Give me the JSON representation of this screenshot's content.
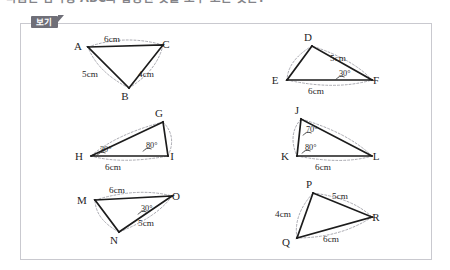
{
  "question": {
    "text": "다음은 삼각형 ABC와 합동인 것을 모두 고른 것은?"
  },
  "panel": {
    "badge_label": "보기"
  },
  "figures": [
    {
      "id": "abc",
      "name": "triangle-abc",
      "vertices": [
        {
          "label": "A",
          "x": 88,
          "y": 47,
          "lx": 78,
          "ly": 50
        },
        {
          "label": "C",
          "x": 163,
          "y": 45,
          "lx": 166,
          "ly": 48
        },
        {
          "label": "B",
          "x": 129,
          "y": 88,
          "lx": 125,
          "ly": 100
        }
      ],
      "measures": [
        {
          "text": "6cm",
          "x": 112,
          "y": 42
        },
        {
          "text": "5cm",
          "x": 90,
          "y": 77
        },
        {
          "text": "4cm",
          "x": 146,
          "y": 77
        }
      ],
      "angles": []
    },
    {
      "id": "def",
      "name": "triangle-def",
      "vertices": [
        {
          "label": "D",
          "x": 312,
          "y": 46,
          "lx": 308,
          "ly": 41
        },
        {
          "label": "E",
          "x": 287,
          "y": 80,
          "lx": 275,
          "ly": 84
        },
        {
          "label": "F",
          "x": 372,
          "y": 80,
          "lx": 376,
          "ly": 84
        }
      ],
      "measures": [
        {
          "text": "5cm",
          "x": 338,
          "y": 61
        },
        {
          "text": "6cm",
          "x": 316,
          "y": 94
        }
      ],
      "angles": [
        {
          "text": "30",
          "x": 339,
          "y": 76
        }
      ]
    },
    {
      "id": "ghi",
      "name": "triangle-ghi",
      "vertices": [
        {
          "label": "G",
          "x": 163,
          "y": 122,
          "lx": 159,
          "ly": 117
        },
        {
          "label": "H",
          "x": 91,
          "y": 156,
          "lx": 79,
          "ly": 160
        },
        {
          "label": "I",
          "x": 168,
          "y": 156,
          "lx": 172,
          "ly": 160
        }
      ],
      "measures": [
        {
          "text": "6cm",
          "x": 113,
          "y": 170
        }
      ],
      "angles": [
        {
          "text": "30",
          "x": 100,
          "y": 152
        },
        {
          "text": "80",
          "x": 146,
          "y": 148
        }
      ]
    },
    {
      "id": "jkl",
      "name": "triangle-jkl",
      "vertices": [
        {
          "label": "J",
          "x": 301,
          "y": 119,
          "lx": 297,
          "ly": 114
        },
        {
          "label": "K",
          "x": 297,
          "y": 156,
          "lx": 285,
          "ly": 160
        },
        {
          "label": "L",
          "x": 372,
          "y": 156,
          "lx": 376,
          "ly": 160
        }
      ],
      "measures": [
        {
          "text": "6cm",
          "x": 323,
          "y": 170
        }
      ],
      "angles": [
        {
          "text": "70",
          "x": 306,
          "y": 132
        },
        {
          "text": "80",
          "x": 305,
          "y": 150
        }
      ]
    },
    {
      "id": "mno",
      "name": "triangle-mno",
      "vertices": [
        {
          "label": "M",
          "x": 95,
          "y": 200,
          "lx": 82,
          "ly": 204
        },
        {
          "label": "O",
          "x": 172,
          "y": 196,
          "lx": 176,
          "ly": 200
        },
        {
          "label": "N",
          "x": 119,
          "y": 232,
          "lx": 114,
          "ly": 244
        }
      ],
      "measures": [
        {
          "text": "6cm",
          "x": 117,
          "y": 193
        },
        {
          "text": "5cm",
          "x": 146,
          "y": 226
        }
      ],
      "angles": [
        {
          "text": "30",
          "x": 141,
          "y": 211
        }
      ]
    },
    {
      "id": "pqr",
      "name": "triangle-pqr",
      "vertices": [
        {
          "label": "P",
          "x": 313,
          "y": 193,
          "lx": 309,
          "ly": 188
        },
        {
          "label": "R",
          "x": 372,
          "y": 217,
          "lx": 376,
          "ly": 221
        },
        {
          "label": "Q",
          "x": 297,
          "y": 238,
          "lx": 286,
          "ly": 246
        }
      ],
      "measures": [
        {
          "text": "5cm",
          "x": 340,
          "y": 199
        },
        {
          "text": "4cm",
          "x": 283,
          "y": 217
        },
        {
          "text": "6cm",
          "x": 331,
          "y": 242
        }
      ],
      "angles": []
    }
  ]
}
